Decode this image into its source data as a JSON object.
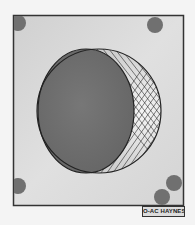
{
  "figure": {
    "caption_label": "O-AC HAYNES",
    "colors": {
      "background": "#f4f4f4",
      "panel_fill": "#d6d6d6",
      "panel_border": "#333333",
      "dark_disc": "#6e6e6e",
      "crescent_fill": "#e2e2e2",
      "hatch_lines": "#2a2a2a",
      "corner_dots": "#6f6f6f"
    },
    "elements": {
      "panel": {
        "label": "square-panel"
      },
      "outer_circle": {
        "label": "outer-circle"
      },
      "dark_disc": {
        "label": "dark-disc"
      },
      "crescent": {
        "label": "cross-hatched-crescent"
      },
      "dots": [
        {
          "position": "top-left"
        },
        {
          "position": "top-right"
        },
        {
          "position": "bottom-left"
        },
        {
          "position": "bottom-right-upper"
        },
        {
          "position": "bottom-right-lower"
        }
      ]
    }
  }
}
